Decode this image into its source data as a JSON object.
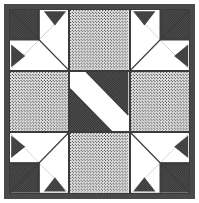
{
  "figure": {
    "width_px": 199,
    "height_px": 203,
    "border_label": "block-outer-border"
  },
  "palette": {
    "dark_fabric": "#5a5a5a",
    "dark_fabric_dot": "#2b2b2b",
    "light_fabric": "#f2f2f2",
    "light_fabric_dot": "#4a4a4a",
    "white_fabric": "#ffffff",
    "line": "#3b3b3b",
    "frame": "#4a4a4a",
    "page": "#ffffff"
  },
  "grid": {
    "rows": 3,
    "columns": 3
  },
  "chart_data": {
    "type": "table",
    "xlabel": "",
    "ylabel": "",
    "categories": [
      "column-1",
      "column-2",
      "column-3"
    ],
    "row_labels": [
      "row-1",
      "row-2",
      "row-3"
    ],
    "legend": [
      "dark fabric",
      "light dotted fabric",
      "white fabric"
    ],
    "cells": [
      {
        "id": "corner-top-left",
        "row": 1,
        "column": 1,
        "unit": "pieced-corner",
        "orientation": "base",
        "fabrics": [
          "dark",
          "white"
        ],
        "description": "Diagonal splits dark upper-left from white lower-right; dark square in corner with two flying-geese triangles."
      },
      {
        "id": "edge-top-center",
        "row": 1,
        "column": 2,
        "unit": "plain-square",
        "orientation": "none",
        "fabrics": [
          "light"
        ],
        "description": "Solid light dotted fabric square."
      },
      {
        "id": "corner-top-right",
        "row": 1,
        "column": 3,
        "unit": "pieced-corner",
        "orientation": "mirror-horizontal",
        "fabrics": [
          "dark",
          "white"
        ],
        "description": "Mirror of top-left corner; dark upper-right, white lower-left."
      },
      {
        "id": "edge-middle-left",
        "row": 2,
        "column": 1,
        "unit": "plain-square",
        "orientation": "none",
        "fabrics": [
          "light"
        ],
        "description": "Solid light dotted fabric square."
      },
      {
        "id": "center-diagonal-band",
        "row": 2,
        "column": 2,
        "unit": "diagonal-band",
        "orientation": "bottom-left-to-top-right",
        "fabrics": [
          "dark",
          "white"
        ],
        "description": "White diagonal band running bottom-left to top-right, flanked by two dark triangles."
      },
      {
        "id": "edge-middle-right",
        "row": 2,
        "column": 3,
        "unit": "plain-square",
        "orientation": "none",
        "fabrics": [
          "light"
        ],
        "description": "Solid light dotted fabric square."
      },
      {
        "id": "corner-bottom-left",
        "row": 3,
        "column": 1,
        "unit": "pieced-corner",
        "orientation": "mirror-vertical",
        "fabrics": [
          "dark",
          "white"
        ],
        "description": "Vertical mirror of top-left corner; dark lower-left, white upper-right."
      },
      {
        "id": "edge-bottom-center",
        "row": 3,
        "column": 2,
        "unit": "plain-square",
        "orientation": "none",
        "fabrics": [
          "light"
        ],
        "description": "Solid light dotted fabric square."
      },
      {
        "id": "corner-bottom-right",
        "row": 3,
        "column": 3,
        "unit": "pieced-corner",
        "orientation": "rotate-180",
        "fabrics": [
          "dark",
          "white"
        ],
        "description": "180-degree rotation of top-left corner; dark lower-right, white upper-left."
      }
    ]
  }
}
